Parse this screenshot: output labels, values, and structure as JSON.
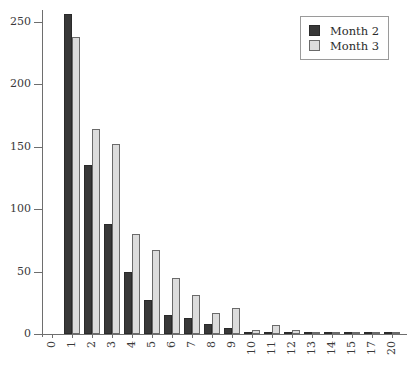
{
  "chart_data": {
    "type": "bar",
    "title": "",
    "subtitle": "",
    "xlabel": "",
    "ylabel": "",
    "grid": false,
    "legend_position": "top-right",
    "categories": [
      "0",
      "1",
      "2",
      "3",
      "4",
      "5",
      "6",
      "7",
      "8",
      "9",
      "10",
      "11",
      "12",
      "13",
      "14",
      "15",
      "17",
      "20"
    ],
    "series": [
      {
        "name": "Month 2",
        "color": "#383838",
        "values": [
          0,
          256,
          135,
          88,
          50,
          27,
          15,
          13,
          8,
          5,
          2,
          1,
          2,
          1,
          1,
          1,
          1,
          1
        ]
      },
      {
        "name": "Month 3",
        "color": "#dcdcdc",
        "values": [
          0,
          238,
          164,
          152,
          80,
          67,
          45,
          31,
          17,
          21,
          3,
          7,
          3,
          2,
          1,
          1,
          1,
          1
        ]
      }
    ],
    "ylim": [
      0,
      257
    ],
    "yticks": [
      0,
      50,
      100,
      150,
      200,
      250
    ],
    "ytick_labels": [
      "0",
      "50",
      "100",
      "150",
      "200",
      "250"
    ]
  },
  "legend": {
    "items": [
      {
        "label": "Month 2",
        "swatch": "dark-square-swatch"
      },
      {
        "label": "Month 3",
        "swatch": "light-square-swatch"
      }
    ]
  }
}
